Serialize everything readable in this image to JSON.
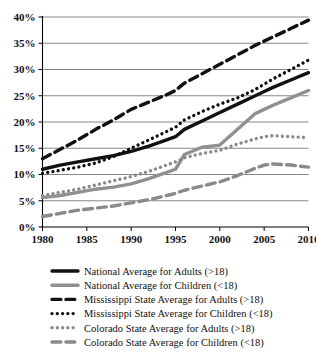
{
  "chart_data": {
    "type": "line",
    "title": "",
    "subtitle": "",
    "xlabel": "",
    "ylabel": "",
    "xlim": [
      1980,
      2010
    ],
    "ylim": [
      0,
      40
    ],
    "grid": true,
    "legend_position": "bottom",
    "x_ticks": [
      "1980",
      "1985",
      "1990",
      "1995",
      "2000",
      "2005",
      "2010"
    ],
    "x_tick_values": [
      1980,
      1985,
      1990,
      1995,
      2000,
      2005,
      2010
    ],
    "y_ticks": [
      "0%",
      "5%",
      "10%",
      "15%",
      "20%",
      "25%",
      "30%",
      "35%",
      "40%"
    ],
    "y_tick_values": [
      0,
      5,
      10,
      15,
      20,
      25,
      30,
      35,
      40
    ],
    "x": [
      1980,
      1982,
      1984,
      1986,
      1988,
      1990,
      1992,
      1994,
      1995,
      1996,
      1998,
      2000,
      2002,
      2004,
      2005,
      2006,
      2008,
      2010
    ],
    "series": [
      {
        "name": "National Average for Adults (>18)",
        "color": "#111111",
        "style": "solid",
        "width": 3.4,
        "values": [
          11.0,
          11.8,
          12.4,
          13.0,
          13.6,
          14.4,
          15.4,
          16.6,
          17.2,
          18.6,
          20.2,
          21.8,
          23.4,
          25.0,
          25.8,
          26.6,
          28.0,
          29.4
        ]
      },
      {
        "name": "National Average for Children (<18)",
        "color": "#909090",
        "style": "solid",
        "width": 3.4,
        "values": [
          5.6,
          6.0,
          6.6,
          7.2,
          7.6,
          8.2,
          9.2,
          10.4,
          11.0,
          13.8,
          15.2,
          15.6,
          18.6,
          21.6,
          22.4,
          23.2,
          24.6,
          26.0
        ]
      },
      {
        "name": "Mississippi State Average for Adults (>18)",
        "color": "#111111",
        "style": "dashed",
        "width": 3.4,
        "values": [
          13.0,
          14.8,
          16.6,
          18.6,
          20.4,
          22.4,
          23.8,
          25.2,
          26.0,
          27.4,
          29.2,
          31.0,
          32.8,
          34.6,
          35.4,
          36.2,
          37.8,
          39.4
        ]
      },
      {
        "name": "Mississippi State Average for Children (<18)",
        "color": "#111111",
        "style": "dotted",
        "width": 3.4,
        "values": [
          10.2,
          10.8,
          11.4,
          12.2,
          13.4,
          15.0,
          16.6,
          18.2,
          19.0,
          20.4,
          22.0,
          23.4,
          24.6,
          26.2,
          27.2,
          28.2,
          30.0,
          31.8
        ]
      },
      {
        "name": "Colorado State Average for Adults (>18)",
        "color": "#8a8a8a",
        "style": "dotted",
        "width": 3.4,
        "values": [
          6.0,
          6.6,
          7.2,
          8.0,
          8.8,
          9.6,
          10.6,
          11.8,
          12.4,
          13.2,
          14.0,
          14.6,
          15.8,
          16.8,
          17.2,
          17.4,
          17.2,
          17.0
        ]
      },
      {
        "name": "Colorado State Average for Children (<18)",
        "color": "#8a8a8a",
        "style": "dashed",
        "width": 3.4,
        "values": [
          2.0,
          2.6,
          3.2,
          3.6,
          4.0,
          4.6,
          5.2,
          6.0,
          6.4,
          7.0,
          7.8,
          8.6,
          9.8,
          11.2,
          11.8,
          12.0,
          11.8,
          11.4
        ]
      }
    ]
  },
  "legend": {
    "items": [
      {
        "label": "National Average for Adults (>18)"
      },
      {
        "label": "National Average for Children (<18)"
      },
      {
        "label": "Mississippi State Average for Adults (>18)"
      },
      {
        "label": "Mississippi State Average for Children (<18)"
      },
      {
        "label": "Colorado State Average for Adults (>18)"
      },
      {
        "label": "Colorado State Average for Children (<18)"
      }
    ]
  }
}
